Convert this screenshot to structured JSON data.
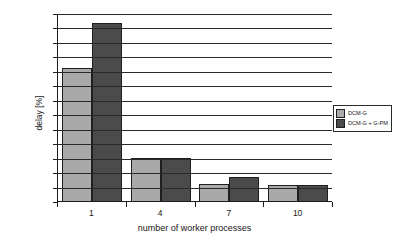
{
  "chart_data": {
    "type": "bar",
    "title": "",
    "xlabel": "number of worker processes",
    "ylabel": "delay [%]",
    "categories": [
      "1",
      "4",
      "7",
      "10"
    ],
    "series": [
      {
        "name": "DCM-G",
        "color": "#a9a9a9",
        "values": [
          23.0,
          7.4,
          3.0,
          2.7
        ]
      },
      {
        "name": "DCM-G + G-PM",
        "color": "#4b4b4b",
        "values": [
          30.8,
          7.4,
          4.1,
          2.7
        ]
      }
    ],
    "ylim": [
      0,
      32.5
    ],
    "yticks": [
      0,
      2.5,
      5,
      7.5,
      10,
      12.5,
      15,
      17.5,
      20,
      22.5,
      25,
      27.5,
      30,
      32.5
    ],
    "ytick_labels": [
      "0",
      "2,5",
      "5",
      "7,5",
      "10",
      "12,5",
      "15",
      "17,5",
      "20",
      "22,5",
      "25",
      "27,5",
      "30",
      "32,5"
    ],
    "grid": true,
    "legend_position": "right"
  }
}
